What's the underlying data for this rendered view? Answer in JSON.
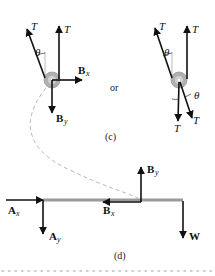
{
  "figure": {
    "part_c": {
      "caption": "(c)",
      "separator_text": "or",
      "left_pulley": {
        "tension_left_label": "T",
        "tension_right_label": "T",
        "angle_label": "θ",
        "bx_label": "B",
        "bx_sub": "x",
        "by_label": "B",
        "by_sub": "y"
      },
      "right_pulley": {
        "tension_up_left_label": "T",
        "tension_up_right_label": "T",
        "angle_top_label": "θ",
        "tension_down_left_label": "T",
        "tension_down_right_label": "T",
        "angle_bottom_label": "θ"
      }
    },
    "part_d": {
      "caption": "(d)",
      "ax_label": "A",
      "ax_sub": "x",
      "ay_label": "A",
      "ay_sub": "y",
      "bx_label": "B",
      "bx_sub": "x",
      "by_label": "B",
      "by_sub": "y",
      "w_label": "W"
    },
    "colors": {
      "arrow": "#111111",
      "beam": "#9a9a9a",
      "pulley_outer": "#a8a8a8",
      "pulley_inner": "#c8c8c8",
      "dashed_curve": "#b0b0b0",
      "dotted_rule": "#c0c0c0"
    }
  }
}
